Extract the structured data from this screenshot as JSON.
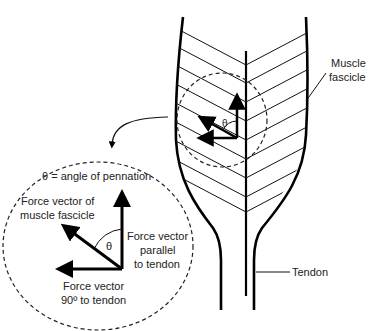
{
  "labels": {
    "muscle_fascicle_1": "Muscle",
    "muscle_fascicle_2": "fascicle",
    "tendon": "Tendon",
    "theta_small": "θ",
    "theta_definition": "θ = angle of pennation",
    "force_fascicle_1": "Force vector of",
    "force_fascicle_2": "muscle fascicle",
    "theta_large": "θ",
    "force_parallel_1": "Force vector",
    "force_parallel_2": "parallel",
    "force_parallel_3": "to tendon",
    "force_90_1": "Force vector",
    "force_90_2": "90º to tendon"
  },
  "colors": {
    "line": "#000000",
    "text": "#222222",
    "background": "#ffffff"
  }
}
